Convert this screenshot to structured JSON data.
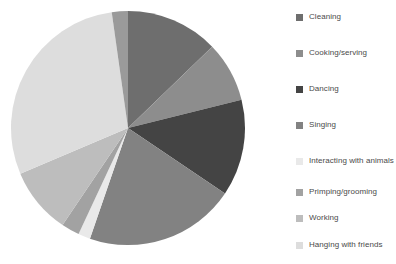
{
  "chart_data": {
    "type": "pie",
    "title": "",
    "subtitle": "",
    "xlabel": "",
    "ylabel": "",
    "grid": false,
    "legend_position": "right",
    "start_angle_deg": 0,
    "direction": "clockwise",
    "center": {
      "x": 118,
      "y": 118
    },
    "radius": 117,
    "categories": [
      "Cleaning",
      "Cooking/serving",
      "Dancing",
      "Singing",
      "Interacting with animals",
      "Primping/grooming",
      "Working",
      "Hanging with friends",
      "Fighting"
    ],
    "values": [
      12.8,
      8.3,
      13.3,
      20.8,
      1.7,
      2.5,
      9.2,
      29.2,
      2.2
    ],
    "angles_deg": [
      46.0,
      30.0,
      48.0,
      75.0,
      6.0,
      9.0,
      33.0,
      105.0,
      8.0
    ],
    "colors": [
      "#6e6e6e",
      "#8d8d8d",
      "#444444",
      "#828282",
      "#e9e9e9",
      "#a2a2a2",
      "#bdbdbd",
      "#dddddd",
      "#9a9a9a"
    ]
  },
  "legend": {
    "items": [
      {
        "label": "Cleaning",
        "color": "#6e6e6e"
      },
      {
        "label": "Cooking/serving",
        "color": "#8d8d8d"
      },
      {
        "label": "Dancing",
        "color": "#444444"
      },
      {
        "label": "Singing",
        "color": "#828282"
      },
      {
        "label": "Interacting with animals",
        "color": "#e9e9e9"
      },
      {
        "label": "Primping/grooming",
        "color": "#a2a2a2"
      },
      {
        "label": "Working",
        "color": "#bdbdbd"
      },
      {
        "label": "Hanging with friends",
        "color": "#dddddd"
      },
      {
        "label": "Fighting",
        "color": "#9a9a9a"
      }
    ],
    "row_tops": [
      6,
      42,
      78,
      114,
      150,
      181,
      207,
      234,
      262
    ]
  },
  "canvas": {
    "background": "#ffffff",
    "text_color": "#4a4a4a"
  }
}
